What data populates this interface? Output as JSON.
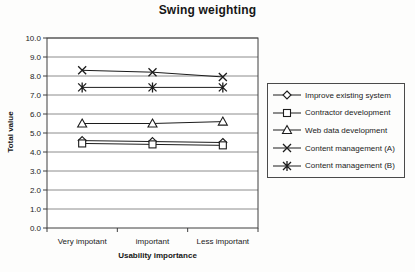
{
  "chart_data": {
    "type": "line",
    "title": "Swing weighting",
    "xlabel": "Usability importance",
    "ylabel": "Total value",
    "categories": [
      "Very impotant",
      "important",
      "Less important"
    ],
    "series": [
      {
        "name": "Improve existing system",
        "marker": "diamond",
        "values": [
          4.6,
          4.55,
          4.5
        ]
      },
      {
        "name": "Contractor development",
        "marker": "square",
        "values": [
          4.45,
          4.4,
          4.35
        ]
      },
      {
        "name": "Web data development",
        "marker": "triangle",
        "values": [
          5.5,
          5.5,
          5.6
        ]
      },
      {
        "name": "Content management (A)",
        "marker": "x",
        "values": [
          8.3,
          8.2,
          7.95
        ]
      },
      {
        "name": "Content management (B)",
        "marker": "star",
        "values": [
          7.4,
          7.4,
          7.4
        ]
      }
    ],
    "ylim": [
      0,
      10
    ],
    "ytick_step": 1,
    "ytick_decimals": 1,
    "grid": true,
    "legend_position": "right",
    "colors": {
      "series_line": "#1c1c1c",
      "gridline": "#8c8c8c",
      "axis": "#3f3f3f",
      "text": "#1b1b1b",
      "plot_background": "#ffffff"
    }
  }
}
